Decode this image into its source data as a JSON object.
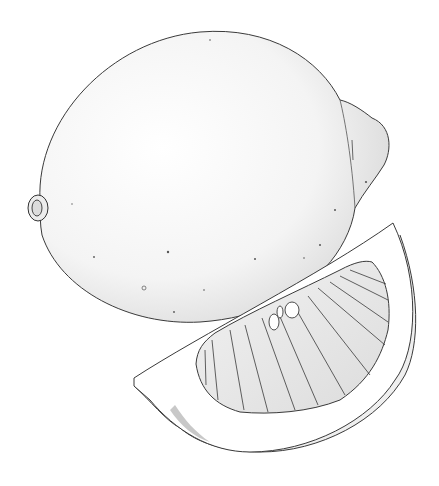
{
  "image": {
    "subject": "Pencil illustration of a whole lemon and a lemon wedge",
    "background": "#ffffff",
    "line_color": "#3a3a3a",
    "shade_color": "#d8d8d8",
    "objects": [
      {
        "name": "whole-lemon"
      },
      {
        "name": "lemon-wedge"
      }
    ]
  }
}
